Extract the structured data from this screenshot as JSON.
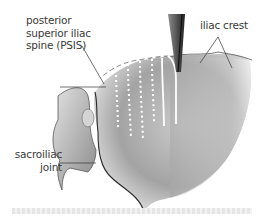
{
  "figure": {
    "labels": {
      "psis": [
        "posterior",
        "superior iliac",
        "spine (PSIS)"
      ],
      "iliac_crest": "iliac crest",
      "sacroiliac_joint": [
        "sacroiliac",
        "joint"
      ]
    },
    "colors": {
      "bone_light": "#d9d9d9",
      "bone_mid": "#a8a8a8",
      "bone_dark": "#6e6e6e",
      "outline": "#2a2a2a",
      "dotted_lines": "#ffffff",
      "leader_lines": "#333333"
    }
  }
}
